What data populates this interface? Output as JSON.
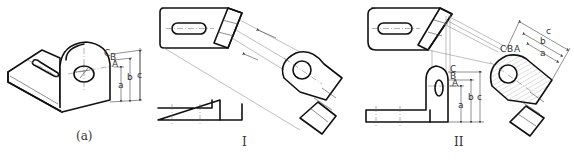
{
  "figure": {
    "panels": [
      {
        "id": "a",
        "caption": "(a)",
        "description": "isometric view of L-bracket with slotted base and lug with hole"
      },
      {
        "id": "I",
        "caption": "I",
        "description": "auxiliary view projection step I"
      },
      {
        "id": "II",
        "caption": "II",
        "description": "auxiliary view projection step II with dimension transfer"
      }
    ],
    "point_labels": [
      "A",
      "B",
      "C"
    ],
    "dimension_labels": [
      "a",
      "b",
      "c"
    ],
    "colors": {
      "line": "#111111",
      "thin": "#888888",
      "background": "#ffffff"
    }
  }
}
